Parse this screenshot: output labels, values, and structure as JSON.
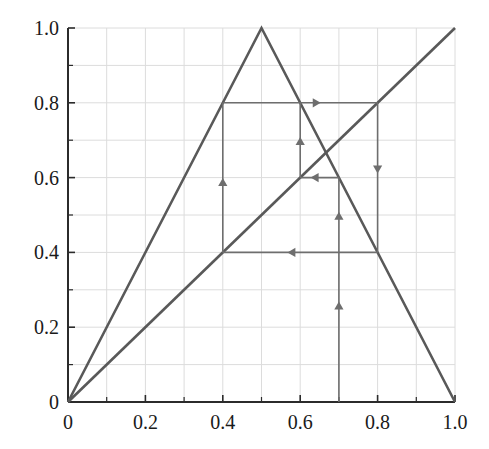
{
  "chart_data": {
    "type": "line",
    "title": "",
    "subtitle": "",
    "xlabel": "",
    "ylabel": "",
    "xlim": [
      0.0,
      1.0
    ],
    "ylim": [
      0.0,
      1.0
    ],
    "grid": true,
    "grid_step": 0.1,
    "legend": "none",
    "x_tick_labels": [
      "0",
      "0.2",
      "0.4",
      "0.6",
      "0.8",
      "1.0"
    ],
    "x_tick_values": [
      0.0,
      0.2,
      0.4,
      0.6,
      0.8,
      1.0
    ],
    "y_tick_labels": [
      "0",
      "0.2",
      "0.4",
      "0.6",
      "0.8",
      "1.0"
    ],
    "y_tick_values": [
      0.0,
      0.2,
      0.4,
      0.6,
      0.8,
      1.0
    ],
    "minor_tick_values": [
      0.1,
      0.3,
      0.5,
      0.7,
      0.9
    ],
    "line_color": "#595959",
    "grid_color": "#dcdcdc",
    "axis_color": "#2b2b2b",
    "cobweb_color": "#6e6e6e",
    "series": [
      {
        "name": "tent-map",
        "type": "line",
        "points": [
          [
            0.0,
            0.0
          ],
          [
            0.5,
            1.0
          ],
          [
            1.0,
            0.0
          ]
        ]
      },
      {
        "name": "identity-line",
        "type": "line",
        "points": [
          [
            0.0,
            0.0
          ],
          [
            1.0,
            1.0
          ]
        ]
      }
    ],
    "cobweb": {
      "start_x": 0.7,
      "segments": [
        {
          "name": "v1",
          "orientation": "vertical",
          "x": 0.7,
          "from": 0.0,
          "to": 0.6,
          "direction": "up",
          "arrows": [
            0.25,
            0.49
          ]
        },
        {
          "name": "h1",
          "orientation": "horizontal",
          "y": 0.6,
          "from": 0.7,
          "to": 0.6,
          "direction": "left",
          "arrows": [
            0.645
          ]
        },
        {
          "name": "v2",
          "orientation": "vertical",
          "x": 0.6,
          "from": 0.6,
          "to": 0.8,
          "direction": "up",
          "arrows": [
            0.69
          ]
        },
        {
          "name": "h2",
          "orientation": "horizontal",
          "y": 0.8,
          "from": 0.4,
          "to": 0.8,
          "direction": "right",
          "arrows": [
            0.635
          ]
        },
        {
          "name": "v3",
          "orientation": "vertical",
          "x": 0.8,
          "from": 0.8,
          "to": 0.4,
          "direction": "down",
          "arrows": [
            0.63
          ]
        },
        {
          "name": "h3",
          "orientation": "horizontal",
          "y": 0.4,
          "from": 0.8,
          "to": 0.4,
          "direction": "left",
          "arrows": [
            0.585
          ]
        },
        {
          "name": "v4",
          "orientation": "vertical",
          "x": 0.4,
          "from": 0.4,
          "to": 0.8,
          "direction": "up",
          "arrows": [
            0.58
          ]
        }
      ]
    }
  }
}
